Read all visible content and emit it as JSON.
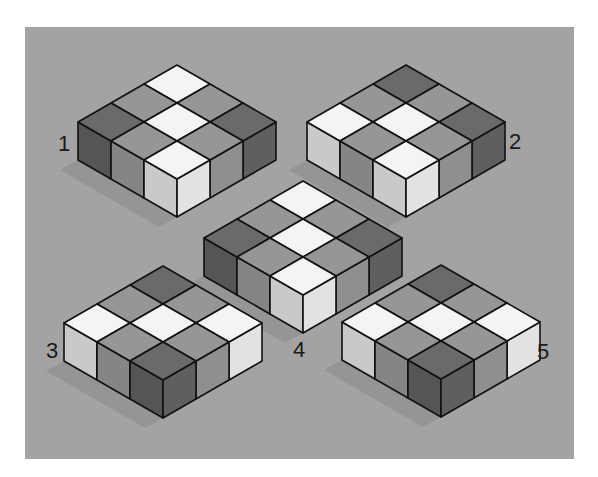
{
  "panel": {
    "background": "#a3a3a3"
  },
  "palette": {
    "white": {
      "top": "#f4f4f4",
      "left": "#c9c9c9",
      "right": "#e2e2e2"
    },
    "medium": {
      "top": "#969696",
      "left": "#858585",
      "right": "#8f8f8f"
    },
    "dark": {
      "top": "#6a6a6a",
      "left": "#555555",
      "right": "#5f5f5f"
    },
    "edge": "#111111",
    "shadow": "#8f8f8f"
  },
  "figures": [
    {
      "label": "1",
      "origin": [
        177,
        65
      ],
      "label_pos": [
        58,
        133
      ],
      "tiles": [
        [
          "white",
          "medium",
          "dark"
        ],
        [
          "medium",
          "white",
          "medium"
        ],
        [
          "dark",
          "medium",
          "white"
        ]
      ]
    },
    {
      "label": "2",
      "origin": [
        406,
        65
      ],
      "label_pos": [
        509,
        131
      ],
      "tiles": [
        [
          "dark",
          "medium",
          "dark"
        ],
        [
          "medium",
          "white",
          "medium"
        ],
        [
          "white",
          "medium",
          "white"
        ]
      ]
    },
    {
      "label": "4",
      "origin": [
        303,
        181
      ],
      "label_pos": [
        293,
        339
      ],
      "tiles": [
        [
          "white",
          "medium",
          "dark"
        ],
        [
          "medium",
          "white",
          "medium"
        ],
        [
          "dark",
          "medium",
          "white"
        ]
      ]
    },
    {
      "label": "3",
      "origin": [
        163,
        266
      ],
      "label_pos": [
        46,
        340
      ],
      "tiles": [
        [
          "dark",
          "medium",
          "white"
        ],
        [
          "medium",
          "white",
          "medium"
        ],
        [
          "white",
          "medium",
          "dark"
        ]
      ]
    },
    {
      "label": "5",
      "origin": [
        441,
        265
      ],
      "label_pos": [
        537,
        341
      ],
      "tiles": [
        [
          "dark",
          "medium",
          "white"
        ],
        [
          "medium",
          "white",
          "medium"
        ],
        [
          "white",
          "medium",
          "dark"
        ]
      ]
    }
  ],
  "geometry": {
    "half_w": 33,
    "half_h": 19,
    "cube_h": 38
  }
}
